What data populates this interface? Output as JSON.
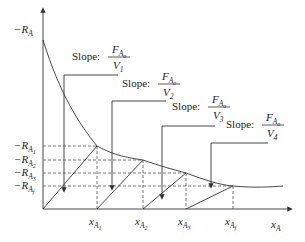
{
  "diagram": {
    "axes": {
      "y_top_label": {
        "main": "−R",
        "sub": "A"
      },
      "x_label": {
        "main": "x",
        "sub": "A"
      }
    },
    "y_levels": [
      {
        "main": "−R",
        "sub": "A",
        "subsub": "1"
      },
      {
        "main": "−R",
        "sub": "A",
        "subsub": "2"
      },
      {
        "main": "−R",
        "sub": "A",
        "subsub": "3"
      },
      {
        "main": "−R",
        "sub": "A",
        "subsub": "f"
      }
    ],
    "x_levels": [
      {
        "main": "x",
        "sub": "A",
        "subsub": "1"
      },
      {
        "main": "x",
        "sub": "A",
        "subsub": "2"
      },
      {
        "main": "x",
        "sub": "A",
        "subsub": "3"
      },
      {
        "main": "x",
        "sub": "A",
        "subsub": "f"
      }
    ],
    "slopes": [
      {
        "prefix": "Slope:",
        "num_main": "F",
        "num_sub": "A",
        "num_subsub": "o",
        "den": "V",
        "den_sub": "1"
      },
      {
        "prefix": "Slope:",
        "num_main": "F",
        "num_sub": "A",
        "num_subsub": "o",
        "den": "V",
        "den_sub": "2"
      },
      {
        "prefix": "Slope:",
        "num_main": "F",
        "num_sub": "A",
        "num_subsub": "o",
        "den": "V",
        "den_sub": "3"
      },
      {
        "prefix": "Slope:",
        "num_main": "F",
        "num_sub": "A",
        "num_subsub": "o",
        "den": "V",
        "den_sub": "4"
      }
    ]
  }
}
